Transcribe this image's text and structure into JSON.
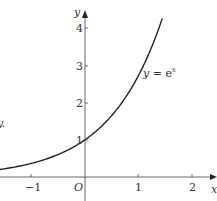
{
  "chart_data": {
    "type": "line",
    "title": "",
    "xlabel": "x",
    "ylabel": "y",
    "curve_label": "y = e^x",
    "function": "exp(x)",
    "x_ticks": [
      -1,
      1,
      2
    ],
    "y_ticks": [
      1,
      2,
      3,
      4
    ],
    "origin_label": "O",
    "xlim": [
      -1.6,
      2.3
    ],
    "ylim": [
      0,
      4.6
    ],
    "grid": false,
    "legend": "none",
    "series": [
      {
        "name": "y = e^x",
        "x": [
          -1.6,
          -1.0,
          -0.5,
          0,
          0.5,
          1.0,
          1.25,
          1.45
        ],
        "y": [
          0.2,
          0.37,
          0.61,
          1.0,
          1.65,
          2.72,
          3.49,
          4.26
        ]
      }
    ],
    "edge_fragment": "y."
  },
  "labels": {
    "x_axis": "x",
    "y_axis": "y",
    "origin": "O",
    "curve_y": "y",
    "curve_eq": " = e",
    "curve_exp": "x",
    "tick_x_neg1": "−1",
    "tick_x_1": "1",
    "tick_x_2": "2",
    "tick_y_1": "1",
    "tick_y_2": "2",
    "tick_y_3": "3",
    "tick_y_4": "4",
    "edge_fragment": "y."
  }
}
